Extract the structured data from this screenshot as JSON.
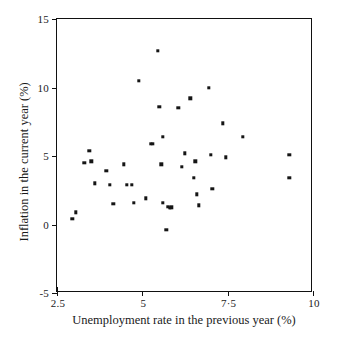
{
  "figure": {
    "top_caption": "",
    "background": "#ffffff",
    "marker_color": "#151515",
    "axis_color": "#111111"
  },
  "chart_data": {
    "type": "scatter",
    "title": "",
    "xlabel": "Unemployment rate in the previous year (%)",
    "ylabel": "Inflation in the current year (%)",
    "xlim": [
      2.5,
      10
    ],
    "ylim": [
      -5,
      15
    ],
    "xticks": [
      2.5,
      5,
      7.5,
      10
    ],
    "xtick_labels": [
      "2.5",
      "5",
      "7·5",
      "10"
    ],
    "yticks": [
      -5,
      0,
      5,
      10,
      15
    ],
    "ytick_labels": [
      "-5",
      "0",
      "5",
      "10",
      "15"
    ],
    "grid": false,
    "legend": null,
    "series": [
      {
        "name": "Unemployment vs inflation",
        "points": [
          {
            "x": 2.95,
            "y": 0.4
          },
          {
            "x": 3.05,
            "y": 0.9
          },
          {
            "x": 3.3,
            "y": 4.5
          },
          {
            "x": 3.45,
            "y": 5.4
          },
          {
            "x": 3.5,
            "y": 4.6
          },
          {
            "x": 3.6,
            "y": 3.0
          },
          {
            "x": 3.95,
            "y": 3.9
          },
          {
            "x": 4.05,
            "y": 2.9
          },
          {
            "x": 4.15,
            "y": 1.5
          },
          {
            "x": 4.45,
            "y": 4.4
          },
          {
            "x": 4.55,
            "y": 2.9
          },
          {
            "x": 4.7,
            "y": 2.9
          },
          {
            "x": 4.75,
            "y": 1.6
          },
          {
            "x": 4.9,
            "y": 10.5
          },
          {
            "x": 5.1,
            "y": 1.9
          },
          {
            "x": 5.25,
            "y": 5.9
          },
          {
            "x": 5.3,
            "y": 5.9
          },
          {
            "x": 5.45,
            "y": 12.7
          },
          {
            "x": 5.5,
            "y": 8.6
          },
          {
            "x": 5.55,
            "y": 4.4
          },
          {
            "x": 5.6,
            "y": 6.4
          },
          {
            "x": 5.6,
            "y": 1.6
          },
          {
            "x": 5.75,
            "y": 1.3
          },
          {
            "x": 5.8,
            "y": 1.2
          },
          {
            "x": 5.85,
            "y": 1.25
          },
          {
            "x": 5.7,
            "y": -0.4
          },
          {
            "x": 6.05,
            "y": 8.5
          },
          {
            "x": 6.15,
            "y": 4.2
          },
          {
            "x": 6.25,
            "y": 5.2
          },
          {
            "x": 6.4,
            "y": 9.2
          },
          {
            "x": 6.5,
            "y": 3.4
          },
          {
            "x": 6.55,
            "y": 4.6
          },
          {
            "x": 6.6,
            "y": 2.2
          },
          {
            "x": 6.65,
            "y": 1.4
          },
          {
            "x": 6.95,
            "y": 10.0
          },
          {
            "x": 7.0,
            "y": 5.1
          },
          {
            "x": 7.05,
            "y": 2.6
          },
          {
            "x": 7.35,
            "y": 7.4
          },
          {
            "x": 7.45,
            "y": 4.9
          },
          {
            "x": 7.95,
            "y": 6.4
          },
          {
            "x": 9.3,
            "y": 5.1
          },
          {
            "x": 9.3,
            "y": 3.4
          }
        ]
      }
    ]
  }
}
